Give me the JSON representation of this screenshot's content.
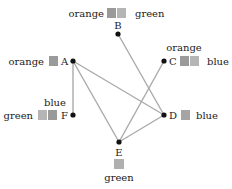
{
  "diagram": {
    "nodes": [
      {
        "id": "A",
        "x": 73,
        "y": 61
      },
      {
        "id": "B",
        "x": 118,
        "y": 34
      },
      {
        "id": "C",
        "x": 164,
        "y": 61
      },
      {
        "id": "D",
        "x": 164,
        "y": 115
      },
      {
        "id": "E",
        "x": 119,
        "y": 142
      },
      {
        "id": "F",
        "x": 73,
        "y": 115
      }
    ],
    "edges": [
      [
        "A",
        "F"
      ],
      [
        "A",
        "E"
      ],
      [
        "A",
        "D"
      ],
      [
        "B",
        "D"
      ],
      [
        "C",
        "E"
      ],
      [
        "E",
        "D"
      ]
    ],
    "labels": {
      "A": "A",
      "B": "B",
      "C": "C",
      "D": "D",
      "E": "E",
      "F": "F",
      "A_left": "orange",
      "B_left": "orange",
      "B_right": "green",
      "C_top": "orange",
      "C_right": "blue",
      "D_right": "blue",
      "E_bottom": "green",
      "F_top": "blue",
      "F_left": "green"
    },
    "colors": {
      "edge": "#aaaaaa",
      "node": "#111111",
      "box": "#b0b0b0",
      "box_dark": "#9a9a9a"
    }
  }
}
